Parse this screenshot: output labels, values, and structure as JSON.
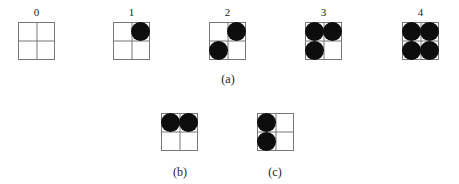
{
  "figure": {
    "row_a": {
      "caption": "(a)",
      "grids": [
        {
          "label": "0",
          "filled": []
        },
        {
          "label": "1",
          "filled": [
            "tr"
          ]
        },
        {
          "label": "2",
          "filled": [
            "tr",
            "bl"
          ]
        },
        {
          "label": "3",
          "filled": [
            "tl",
            "tr",
            "bl"
          ]
        },
        {
          "label": "4",
          "filled": [
            "tl",
            "tr",
            "bl",
            "br"
          ]
        }
      ]
    },
    "row_b": {
      "caption": "(b)",
      "filled": [
        "tl",
        "tr"
      ]
    },
    "row_c": {
      "caption": "(c)",
      "filled": [
        "tl",
        "bl"
      ]
    }
  }
}
